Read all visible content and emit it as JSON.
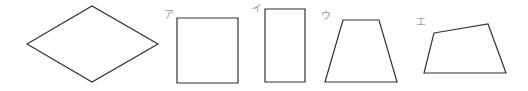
{
  "figure": {
    "stroke_color": "#333333",
    "label_color": "#9a9a9a",
    "shapes": [
      {
        "name": "rhombus",
        "label": "",
        "points": "27,44 92,6 158,44 92,82"
      },
      {
        "name": "square",
        "label": "ア",
        "points": "177,18 238,18 238,83 177,83",
        "label_pos": [
          164,
          10
        ]
      },
      {
        "name": "rectangle",
        "label": "イ",
        "points": "265,9 305,9 305,82 265,82",
        "label_pos": [
          252,
          4
        ]
      },
      {
        "name": "trapezoid",
        "label": "ウ",
        "points": "343,20 379,20 397,82 325,82",
        "label_pos": [
          321,
          11
        ]
      },
      {
        "name": "quadrilateral",
        "label": "エ",
        "points": "434,33 488,24 506,73 424,73",
        "label_pos": [
          416,
          17
        ]
      }
    ]
  }
}
